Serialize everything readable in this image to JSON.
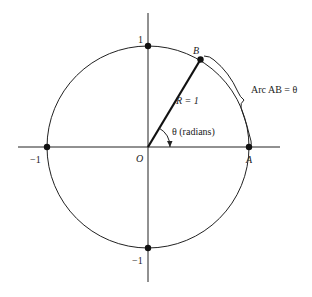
{
  "diagram": {
    "type": "unit-circle-radian",
    "colors": {
      "stroke": "#222222",
      "background": "#ffffff"
    },
    "labels": {
      "top": "1",
      "bottom": "−1",
      "left": "−1",
      "origin": "O",
      "point_a": "A",
      "point_b": "B",
      "radius": "R = 1",
      "angle": "θ (radians)",
      "arc": "Arc AB = θ"
    },
    "geometry": {
      "center": [
        148,
        147
      ],
      "radius": 101,
      "angle_deg": 60
    }
  }
}
